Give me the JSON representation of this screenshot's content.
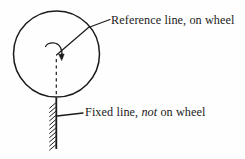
{
  "figure": {
    "background_color": "#fefefe",
    "ink_color": "#1b1b1b",
    "labels": {
      "reference": {
        "full_text": "Reference line, on wheel",
        "part_plain_1": "Reference line, on wheel"
      },
      "fixed": {
        "full_text": "Fixed line, not on wheel",
        "part_plain_1": "Fixed line, ",
        "part_italic": "not",
        "part_plain_2": " on wheel"
      }
    },
    "geometry": {
      "wheel": {
        "shape": "circle",
        "center_x": 56.5,
        "center_y": 54,
        "radius": 43,
        "stroke_width": 1.4
      },
      "reference_line": {
        "from_x": 56.5,
        "from_y": 54,
        "to_x": 88,
        "to_y": 28,
        "style": "solid"
      },
      "dashed_line": {
        "from_x": 56.5,
        "from_y": 58,
        "to_x": 56.5,
        "to_y": 97,
        "style": "dashed"
      },
      "fixed_line": {
        "from_x": 56.5,
        "from_y": 98,
        "to_x": 56.5,
        "to_y": 149,
        "style": "solid",
        "hatching_side": "left",
        "hatch_count": 11
      },
      "rotation_arrow": {
        "type": "curved-arrow",
        "direction": "clockwise",
        "tip_x": 62,
        "tip_y": 60
      },
      "leader_reference": {
        "from_x": 88,
        "from_y": 28,
        "to_x": 110,
        "to_y": 20
      },
      "leader_fixed": {
        "from_x": 57,
        "from_y": 116,
        "to_x": 83,
        "to_y": 113
      }
    }
  }
}
